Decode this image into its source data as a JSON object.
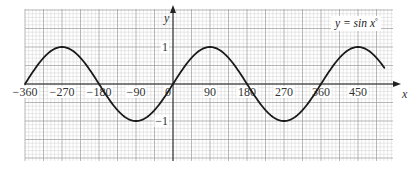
{
  "chart_data": {
    "type": "line",
    "title": "",
    "annotation": "y = sin x°",
    "xlabel": "x",
    "ylabel": "y",
    "function": "sin",
    "x": [
      -360,
      -315,
      -270,
      -225,
      -180,
      -135,
      -90,
      -45,
      0,
      45,
      90,
      135,
      180,
      225,
      270,
      315,
      360,
      405,
      450,
      495,
      515
    ],
    "series": [
      {
        "name": "y = sin x°",
        "values": [
          0,
          0.707,
          1,
          0.707,
          0,
          -0.707,
          -1,
          -0.707,
          0,
          0.707,
          1,
          0.707,
          0,
          -0.707,
          -1,
          -0.707,
          0,
          0.707,
          1,
          0.707,
          0.41
        ]
      }
    ],
    "x_ticks": [
      -360,
      -270,
      -180,
      -90,
      0,
      90,
      180,
      270,
      360,
      450
    ],
    "x_tick_labels": [
      "−360",
      "−270",
      "−180",
      "−90",
      "0",
      "90",
      "180",
      "270",
      "360",
      "450"
    ],
    "y_ticks": [
      1,
      -1
    ],
    "y_tick_labels": [
      "1",
      "−1"
    ],
    "xlim": [
      -360,
      545
    ],
    "ylim": [
      -2.1,
      2.05
    ],
    "grid": true,
    "grid_style": "graph paper (minor + major lines)",
    "legend": "none",
    "colors": {
      "curve": "#1a1a1a",
      "axis": "#222222",
      "grid_minor": "#d2d2d2",
      "grid_major": "#9a9a9a"
    }
  },
  "labels": {
    "equation": "y = sin x",
    "degree": "°",
    "x_axis": "x",
    "y_axis": "y",
    "origin": "0"
  }
}
